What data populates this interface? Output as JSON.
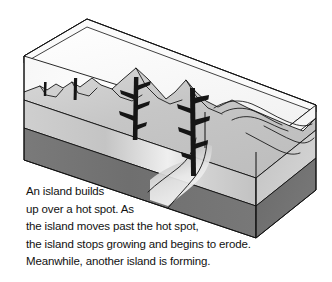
{
  "figure": {
    "caption_lines": [
      "An island builds",
      "up over a hot spot. As",
      "the island moves past the hot spot,",
      "the island stops growing and begins to erode.",
      "Meanwhile, another island is forming."
    ],
    "layers": [
      {
        "name": "water",
        "label": "ocean water",
        "color": "#fbfbfb"
      },
      {
        "name": "crust",
        "label": "oceanic crust",
        "color": "#c9c9c9"
      },
      {
        "name": "mantle",
        "label": "mantle",
        "color": "#808080"
      },
      {
        "name": "mantle-front",
        "label": "mantle front face",
        "color": "#6f6f6f"
      },
      {
        "name": "magma",
        "label": "magma conduit",
        "color": "#1a1a1a"
      }
    ],
    "features": [
      {
        "name": "eroded-seamount-left",
        "label": "eroded seamount"
      },
      {
        "name": "old-island-peak",
        "label": "older island peak"
      },
      {
        "name": "active-island-peak",
        "label": "active island over hot spot"
      },
      {
        "name": "submerged-guyot-right",
        "label": "submerged eroded island"
      },
      {
        "name": "hot-spot-plume",
        "label": "hot spot plume"
      }
    ],
    "colors": {
      "outline": "#111111",
      "water": "#fbfbfb",
      "crust": "#c9c9c9",
      "crust_light": "#dcdcdc",
      "mantle_top": "#8a8a8a",
      "mantle_front": "#6e6e6e",
      "magma": "#151515",
      "background": "#ffffff",
      "text": "#111111"
    }
  }
}
